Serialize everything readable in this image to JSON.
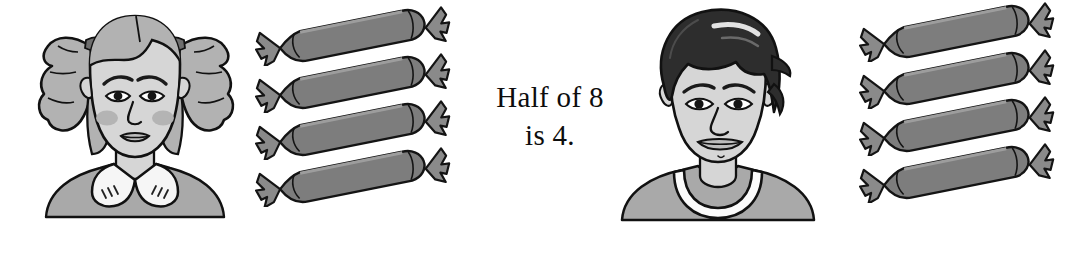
{
  "page": {
    "background_color": "#ffffff",
    "width": 1077,
    "height": 255
  },
  "caption": {
    "line1": "Half of 8",
    "line2": "is 4.",
    "full_text": "Half of 8 is 4.",
    "text_color": "#0d0d0d"
  },
  "figures": {
    "girl": {
      "label": "girl with pigtails",
      "hair_color": "#b2b2b2",
      "skin_color": "#d6d6d6",
      "clothing_color": "#a9a9a9",
      "collar_color": "#f6f6f6",
      "outline_color": "#111111"
    },
    "boy": {
      "label": "boy with dark wavy hair",
      "hair_color": "#2d2d2d",
      "skin_color": "#d6d6d6",
      "clothing_color": "#a9a9a9",
      "collar_color": "#fbfbfb",
      "outline_color": "#111111"
    }
  },
  "candy_groups": [
    {
      "owner": "girl",
      "side": "left",
      "count": 4,
      "items": [
        "candy-1",
        "candy-2",
        "candy-3",
        "candy-4"
      ]
    },
    {
      "owner": "boy",
      "side": "right",
      "count": 4,
      "items": [
        "candy-1",
        "candy-2",
        "candy-3",
        "candy-4"
      ]
    }
  ],
  "candy_style": {
    "body_color": "#7d7d7d",
    "wrapper_color": "#8a8a8a",
    "highlight_color": "#9a9a9a",
    "outline_color": "#141414"
  },
  "math": {
    "total": 8,
    "half": 4,
    "operation": "half of"
  }
}
